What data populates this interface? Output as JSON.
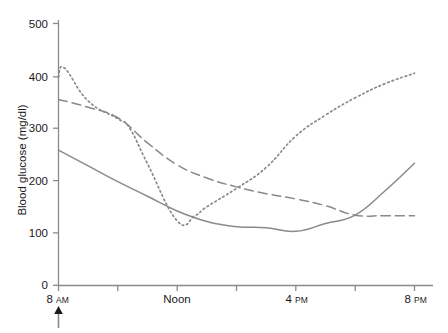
{
  "chart_data": {
    "type": "line",
    "title": "",
    "subtitle": "",
    "xlabel": "",
    "ylabel": "Blood glucose (mg/dl)",
    "xlim": [
      8,
      20
    ],
    "ylim": [
      0,
      500
    ],
    "grid": false,
    "legend": "none",
    "x_tick_labels": [
      "8 AM",
      "Noon",
      "4 PM",
      "8 PM"
    ],
    "x_tick_values": [
      8,
      12,
      16,
      20
    ],
    "x_minor_tick_values": [
      10,
      14,
      18
    ],
    "y_tick_labels": [
      "0",
      "100",
      "200",
      "300",
      "400",
      "500"
    ],
    "y_tick_values": [
      0,
      100,
      200,
      300,
      400,
      500
    ],
    "annotations": [
      {
        "name": "meal-arrow",
        "symbol": "↑",
        "x_value": 8,
        "label": ""
      }
    ],
    "series": [
      {
        "name": "dotted-series",
        "style": "dotted",
        "color": "#8a8a8a",
        "x": [
          8,
          8.2,
          9,
          10,
          10.4,
          11,
          12,
          12.6,
          13,
          14,
          15,
          16,
          17,
          18,
          19,
          20
        ],
        "values": [
          398,
          415,
          352,
          318,
          300,
          232,
          123,
          133,
          150,
          185,
          225,
          285,
          325,
          358,
          385,
          405
        ]
      },
      {
        "name": "dashed-series",
        "style": "dashed",
        "color": "#8a8a8a",
        "x": [
          8,
          9,
          10,
          11,
          12,
          13,
          14,
          15,
          16,
          17,
          18,
          19,
          20
        ],
        "values": [
          355,
          340,
          320,
          272,
          230,
          205,
          188,
          175,
          165,
          152,
          134,
          133,
          133
        ]
      },
      {
        "name": "solid-series",
        "style": "solid",
        "color": "#8a8a8a",
        "x": [
          8,
          9,
          10,
          11,
          12,
          13,
          14,
          15,
          16,
          17,
          18,
          19,
          20
        ],
        "values": [
          258,
          228,
          198,
          170,
          142,
          122,
          112,
          110,
          103,
          118,
          134,
          180,
          233
        ]
      }
    ]
  },
  "axis": {
    "y_title": "Blood glucose (mg/dl)"
  },
  "x_ticks": [
    {
      "main": "8",
      "suffix": "AM"
    },
    {
      "main": "Noon",
      "suffix": ""
    },
    {
      "main": "4",
      "suffix": "PM"
    },
    {
      "main": "8",
      "suffix": "PM"
    }
  ],
  "y_ticks": [
    "500",
    "400",
    "300",
    "200",
    "100",
    "0"
  ]
}
